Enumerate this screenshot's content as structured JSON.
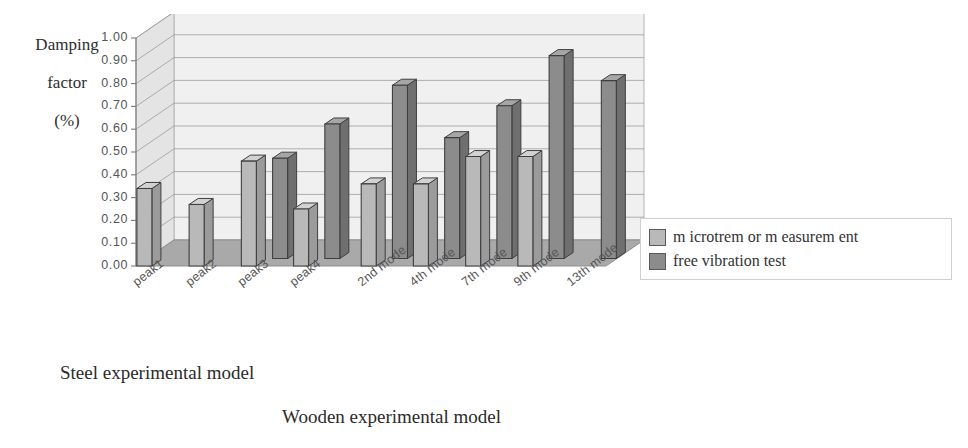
{
  "chart_data": {
    "type": "bar",
    "title": "",
    "xlabel": "",
    "ylabel": "Damping factor (%)",
    "ylim": [
      0.0,
      1.0
    ],
    "ytick_labels": [
      "1.00",
      "0.90",
      "0.80",
      "0.70",
      "0.60",
      "0.50",
      "0.40",
      "0.30",
      "0.20",
      "0.10",
      "0.00"
    ],
    "ytick_values": [
      1.0,
      0.9,
      0.8,
      0.7,
      0.6,
      0.5,
      0.4,
      0.3,
      0.2,
      0.1,
      0.0
    ],
    "grid": true,
    "three_d": true,
    "legend_position": "right",
    "categories": [
      "peak1",
      "peak2",
      "peak3",
      "peak4",
      "2nd mode",
      "4th mode",
      "7th mode",
      "9th mode",
      "13th mode"
    ],
    "groups": [
      {
        "caption": "Steel experimental model",
        "categories": [
          "peak1",
          "peak2",
          "peak3",
          "peak4"
        ]
      },
      {
        "caption": "Wooden experimental model",
        "categories": [
          "2nd mode",
          "4th mode",
          "7th mode",
          "9th mode",
          "13th mode"
        ]
      }
    ],
    "series": [
      {
        "name": "m icrotrem or m easurem ent",
        "color": "#b9b9b9",
        "values": [
          0.34,
          0.27,
          0.46,
          0.25,
          0.36,
          0.36,
          0.48,
          0.48,
          null
        ]
      },
      {
        "name": "free vibration test",
        "color": "#8c8c8c",
        "values": [
          null,
          null,
          0.44,
          0.59,
          0.76,
          0.53,
          0.67,
          0.89,
          0.78
        ]
      }
    ]
  },
  "y_axis_title": {
    "line1": "Damping",
    "line2": "factor",
    "line3": "(%)"
  },
  "legend": {
    "items": [
      {
        "label": "m icrotrem or m easurem ent",
        "color": "#b9b9b9"
      },
      {
        "label": "free vibration test",
        "color": "#8c8c8c"
      }
    ]
  },
  "colors": {
    "wall": "#f0f0f0",
    "wall_side": "#e4e4e4",
    "floor": "#a9a9a9",
    "gridline": "#9a9a9a",
    "bar_light": "#b9b9b9",
    "bar_dark": "#8c8c8c",
    "bar_outline": "#3f3f3f",
    "text": "#555555"
  }
}
